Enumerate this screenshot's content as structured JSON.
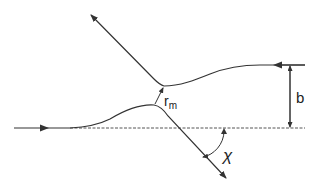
{
  "diagram": {
    "type": "scattering-trajectory",
    "labels": {
      "impact_parameter": "b",
      "min_distance": "r",
      "min_distance_sub": "m",
      "scattering_angle": "χ"
    },
    "colors": {
      "stroke": "#333333",
      "background": "#ffffff"
    }
  }
}
